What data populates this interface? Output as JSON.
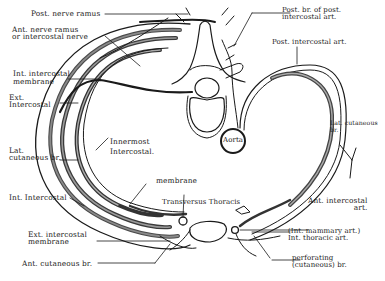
{
  "figure": {
    "colors": {
      "ink": "#1a1a1a",
      "muscle_fill": "#5a5a5a",
      "background": "#ffffff"
    }
  },
  "labels": {
    "post_nerve_ramus": "Post. nerve ramus",
    "ant_nerve_ramus": "Ant. nerve ramus\nor intercostal nerve",
    "int_intercostal_membrane": "Int. intercostal\nmembrane",
    "ext_intercostal": "Ext.\nIntercostal",
    "lat_cutaneous_br_left": "Lat.\ncutaneous br.",
    "innermost_intercostal": "Innermost\nIntercostal.",
    "membrane": "membrane",
    "int_intercostal": "Int. Intercostal",
    "transversus_thoracis": "Transversus Thoracis",
    "ext_intercostal_membrane": "Ext. intercostal\nmembrane",
    "ant_cutaneous_br": "Ant. cutaneous br.",
    "post_br_of_post_intercostal_art": "Post. br. of post.\nintercostal art.",
    "post_intercostal_art": "Post. intercostal art.",
    "aorta": "Aorta",
    "lat_cutaneous_br_right": "Lat. cutaneous\nbr.",
    "ant_intercostal_art": "Ant. intercostal\nart.",
    "int_mammary_art": "(Int. mammary art.)\nInt. thoracic art.",
    "perforating_br": "perforating\n(cutaneous) br."
  }
}
